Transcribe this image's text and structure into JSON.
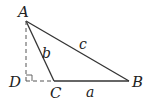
{
  "diagram": {
    "type": "triangle-with-altitude",
    "points": {
      "A": {
        "label": "A",
        "x": 26,
        "y": 21
      },
      "B": {
        "label": "B",
        "x": 129,
        "y": 81
      },
      "C": {
        "label": "C",
        "x": 54,
        "y": 81
      },
      "D": {
        "label": "D",
        "x": 26,
        "y": 81
      }
    },
    "sides": {
      "a": {
        "label": "a",
        "from": "C",
        "to": "B"
      },
      "b": {
        "label": "b",
        "from": "A",
        "to": "C"
      },
      "c": {
        "label": "c",
        "from": "A",
        "to": "B"
      }
    },
    "dashed": [
      "AD",
      "DC"
    ],
    "right_angle_at": "D",
    "colors": {
      "line": "#333333",
      "dashed": "#555555",
      "text": "#222222"
    }
  }
}
